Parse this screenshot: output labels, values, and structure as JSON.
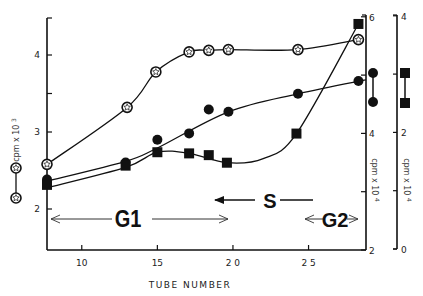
{
  "chart_data": {
    "type": "line",
    "title": "",
    "xlabel": "TUBE NUMBER",
    "xlim": [
      7.7,
      28.8
    ],
    "xticks": [
      10,
      15,
      20,
      25
    ],
    "xtick_labels": [
      "10",
      "15",
      "2 0",
      "2 5"
    ],
    "grid": false,
    "axes": [
      {
        "id": "left",
        "label": "cpm x 10",
        "exponent": "3",
        "range": [
          1.45,
          4.75
        ],
        "ticks": [
          2,
          3,
          4
        ],
        "minor_ticks": [
          3.5
        ],
        "legend_symbol": "open-star"
      },
      {
        "id": "right1",
        "label": "cpm x 10",
        "exponent": "4",
        "range": [
          2,
          6
        ],
        "ticks": [
          2,
          4,
          6
        ],
        "minor_ticks": [
          3,
          5
        ],
        "legend_symbol": "filled-circle"
      },
      {
        "id": "right2",
        "label": "cpm x 10",
        "exponent": "4",
        "range": [
          0,
          4
        ],
        "ticks": [
          0,
          2,
          4
        ],
        "minor_ticks": [
          1,
          3
        ],
        "legend_symbol": "filled-square"
      }
    ],
    "series": [
      {
        "name": "open-star",
        "axis": "left",
        "marker": "star",
        "x": [
          7.7,
          13.0,
          14.9,
          17.1,
          18.4,
          19.7,
          24.3,
          28.3
        ],
        "y": [
          2.58,
          3.32,
          3.78,
          4.04,
          4.06,
          4.07,
          4.07,
          4.2
        ]
      },
      {
        "name": "filled-circle",
        "axis": "right1",
        "marker": "circle",
        "x": [
          7.7,
          12.9,
          15.0,
          17.1,
          18.4,
          19.7,
          24.3,
          28.3
        ],
        "y": [
          3.21,
          3.5,
          3.89,
          4.0,
          4.41,
          4.37,
          4.68,
          4.9
        ],
        "curve": [
          [
            7.7,
            3.18
          ],
          [
            12.9,
            3.52
          ],
          [
            15.0,
            3.75
          ],
          [
            19.7,
            4.37
          ],
          [
            24.3,
            4.68
          ],
          [
            28.8,
            4.92
          ]
        ]
      },
      {
        "name": "filled-square",
        "axis": "right2",
        "marker": "square",
        "x": [
          7.7,
          12.9,
          15.0,
          17.1,
          18.4,
          19.6,
          24.2,
          28.3
        ],
        "y": [
          1.1,
          1.43,
          1.66,
          1.64,
          1.61,
          1.48,
          1.98,
          3.86
        ]
      }
    ],
    "annotations": [
      {
        "text": "G1",
        "span": [
          7.8,
          19.5
        ],
        "arrows": "both"
      },
      {
        "text": "S",
        "span": [
          18.6,
          28.8
        ],
        "arrows": "left"
      },
      {
        "text": "G2",
        "span": [
          24.6,
          28.5
        ],
        "arrows": "both"
      }
    ]
  }
}
